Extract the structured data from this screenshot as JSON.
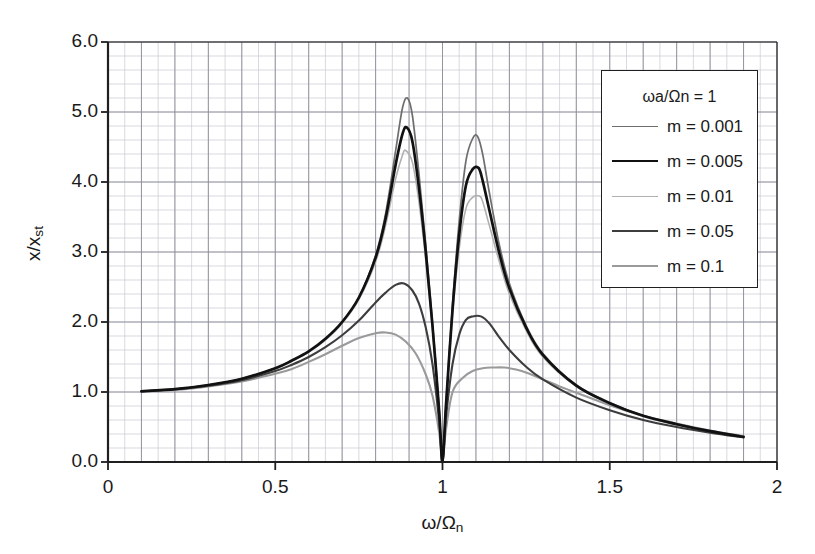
{
  "chart_data": {
    "type": "line",
    "title": "",
    "xlabel": "ω/Ωn",
    "ylabel": "x/xst",
    "xlim": [
      0,
      2
    ],
    "ylim": [
      0,
      6
    ],
    "xticks": [
      "0",
      "0.5",
      "1",
      "1.5",
      "2"
    ],
    "xtick_values": [
      0,
      0.5,
      1,
      1.5,
      2
    ],
    "yticks": [
      "0.0",
      "1.0",
      "2.0",
      "3.0",
      "4.0",
      "5.0",
      "6.0"
    ],
    "ytick_values": [
      0,
      1,
      2,
      3,
      4,
      5,
      6
    ],
    "grid": "major and minor, minor x every 0.05, minor y every 0.2",
    "legend_position": "upper right inside plot",
    "legend_title": "ωa/Ωn = 1",
    "antiresonance_x": 1.0,
    "series": [
      {
        "name": "m = 0.001",
        "color": "#6e6e6e",
        "width": 1.7,
        "peak_left": {
          "x": 0.895,
          "y": 5.2
        },
        "peak_right": {
          "x": 1.105,
          "y": 4.65
        },
        "x": [
          0.1,
          0.2,
          0.3,
          0.4,
          0.5,
          0.55,
          0.6,
          0.65,
          0.7,
          0.75,
          0.8,
          0.83,
          0.86,
          0.88,
          0.895,
          0.91,
          0.93,
          0.95,
          0.97,
          0.99,
          1.0,
          1.01,
          1.03,
          1.05,
          1.07,
          1.09,
          1.105,
          1.12,
          1.14,
          1.17,
          1.2,
          1.25,
          1.3,
          1.4,
          1.5,
          1.6,
          1.7,
          1.8,
          1.9
        ],
        "y": [
          1.01,
          1.04,
          1.1,
          1.19,
          1.34,
          1.45,
          1.58,
          1.76,
          2.0,
          2.35,
          2.95,
          3.55,
          4.45,
          5.05,
          5.2,
          4.95,
          4.1,
          3.1,
          2.0,
          0.75,
          0.0,
          0.8,
          2.25,
          3.45,
          4.3,
          4.62,
          4.65,
          4.4,
          3.85,
          3.1,
          2.55,
          1.95,
          1.55,
          1.1,
          0.85,
          0.66,
          0.54,
          0.44,
          0.36
        ]
      },
      {
        "name": "m = 0.005",
        "color": "#111111",
        "width": 2.7,
        "peak_left": {
          "x": 0.893,
          "y": 4.78
        },
        "peak_right": {
          "x": 1.108,
          "y": 4.2
        },
        "x": [
          0.1,
          0.2,
          0.3,
          0.4,
          0.5,
          0.55,
          0.6,
          0.65,
          0.7,
          0.75,
          0.8,
          0.83,
          0.86,
          0.88,
          0.893,
          0.91,
          0.93,
          0.95,
          0.97,
          0.99,
          1.0,
          1.01,
          1.03,
          1.05,
          1.07,
          1.09,
          1.108,
          1.12,
          1.14,
          1.17,
          1.2,
          1.25,
          1.3,
          1.4,
          1.5,
          1.6,
          1.7,
          1.8,
          1.9
        ],
        "y": [
          1.01,
          1.04,
          1.1,
          1.19,
          1.34,
          1.45,
          1.58,
          1.76,
          2.0,
          2.35,
          2.92,
          3.48,
          4.25,
          4.68,
          4.78,
          4.58,
          3.9,
          3.0,
          1.95,
          0.73,
          0.0,
          0.78,
          2.18,
          3.25,
          3.95,
          4.18,
          4.2,
          4.02,
          3.6,
          2.98,
          2.48,
          1.92,
          1.53,
          1.09,
          0.84,
          0.66,
          0.54,
          0.44,
          0.36
        ]
      },
      {
        "name": "m = 0.01",
        "color": "#b0b0b0",
        "width": 1.6,
        "peak_left": {
          "x": 0.89,
          "y": 4.45
        },
        "peak_right": {
          "x": 1.11,
          "y": 3.8
        },
        "x": [
          0.1,
          0.2,
          0.3,
          0.4,
          0.5,
          0.55,
          0.6,
          0.65,
          0.7,
          0.75,
          0.8,
          0.83,
          0.86,
          0.88,
          0.89,
          0.91,
          0.93,
          0.95,
          0.97,
          0.99,
          1.0,
          1.01,
          1.03,
          1.05,
          1.07,
          1.09,
          1.11,
          1.12,
          1.14,
          1.17,
          1.2,
          1.25,
          1.3,
          1.4,
          1.5,
          1.6,
          1.7,
          1.8,
          1.9
        ],
        "y": [
          1.01,
          1.04,
          1.1,
          1.19,
          1.33,
          1.44,
          1.57,
          1.74,
          1.98,
          2.32,
          2.86,
          3.38,
          4.05,
          4.38,
          4.45,
          4.28,
          3.7,
          2.88,
          1.9,
          0.72,
          0.0,
          0.76,
          2.1,
          3.05,
          3.62,
          3.78,
          3.8,
          3.72,
          3.38,
          2.86,
          2.4,
          1.88,
          1.5,
          1.08,
          0.84,
          0.65,
          0.53,
          0.43,
          0.36
        ]
      },
      {
        "name": "m = 0.05",
        "color": "#3d3d3d",
        "width": 2.1,
        "peak_left": {
          "x": 0.885,
          "y": 2.55
        },
        "peak_right": {
          "x": 1.115,
          "y": 2.08
        },
        "x": [
          0.1,
          0.2,
          0.3,
          0.4,
          0.5,
          0.55,
          0.6,
          0.65,
          0.7,
          0.75,
          0.8,
          0.83,
          0.86,
          0.885,
          0.91,
          0.93,
          0.95,
          0.97,
          0.99,
          1.0,
          1.01,
          1.03,
          1.05,
          1.07,
          1.09,
          1.115,
          1.14,
          1.17,
          1.2,
          1.25,
          1.3,
          1.4,
          1.5,
          1.6,
          1.7,
          1.8,
          1.9
        ],
        "y": [
          1.01,
          1.04,
          1.09,
          1.17,
          1.3,
          1.39,
          1.5,
          1.64,
          1.81,
          2.02,
          2.28,
          2.42,
          2.53,
          2.55,
          2.45,
          2.26,
          1.92,
          1.4,
          0.58,
          0.0,
          0.62,
          1.4,
          1.82,
          2.03,
          2.08,
          2.08,
          1.98,
          1.78,
          1.6,
          1.36,
          1.18,
          0.92,
          0.74,
          0.6,
          0.5,
          0.42,
          0.35
        ]
      },
      {
        "name": "m = 0.1",
        "color": "#9a9a9a",
        "width": 2.1,
        "peak_left": {
          "x": 0.83,
          "y": 1.85
        },
        "peak_right": {
          "x": 1.185,
          "y": 1.35
        },
        "x": [
          0.1,
          0.2,
          0.3,
          0.4,
          0.5,
          0.55,
          0.6,
          0.65,
          0.7,
          0.75,
          0.8,
          0.83,
          0.86,
          0.89,
          0.92,
          0.95,
          0.97,
          0.99,
          1.0,
          1.01,
          1.03,
          1.06,
          1.09,
          1.12,
          1.15,
          1.185,
          1.22,
          1.26,
          1.3,
          1.35,
          1.4,
          1.5,
          1.6,
          1.7,
          1.8,
          1.9
        ],
        "y": [
          1.01,
          1.03,
          1.08,
          1.15,
          1.26,
          1.33,
          1.43,
          1.54,
          1.66,
          1.77,
          1.84,
          1.85,
          1.82,
          1.72,
          1.55,
          1.25,
          0.95,
          0.42,
          0.0,
          0.45,
          1.0,
          1.2,
          1.3,
          1.34,
          1.35,
          1.35,
          1.32,
          1.26,
          1.18,
          1.08,
          0.99,
          0.81,
          0.66,
          0.55,
          0.45,
          0.37
        ]
      }
    ]
  },
  "axes": {
    "y_title_main": "x/x",
    "y_title_sub": "st",
    "x_title_main": "ω/Ω",
    "x_title_sub": "n",
    "yticks": [
      "6.0",
      "5.0",
      "4.0",
      "3.0",
      "2.0",
      "1.0",
      "0.0"
    ],
    "xticks": [
      "0",
      "0.5",
      "1",
      "1.5",
      "2"
    ]
  },
  "legend": {
    "title": "ωa/Ωn = 1",
    "items": [
      {
        "label": "m = 0.001",
        "color": "#6e6e6e",
        "width": 1.7
      },
      {
        "label": "m = 0.005",
        "color": "#111111",
        "width": 2.7
      },
      {
        "label": "m = 0.01",
        "color": "#b0b0b0",
        "width": 1.6
      },
      {
        "label": "m = 0.05",
        "color": "#3d3d3d",
        "width": 2.1
      },
      {
        "label": "m = 0.1",
        "color": "#9a9a9a",
        "width": 2.1
      }
    ]
  },
  "colors": {
    "background": "#ffffff",
    "axis": "#1f1f1f",
    "grid_major": "#8c8c99",
    "grid_minor": "#c9c9d2",
    "text": "#1a1a1a"
  }
}
